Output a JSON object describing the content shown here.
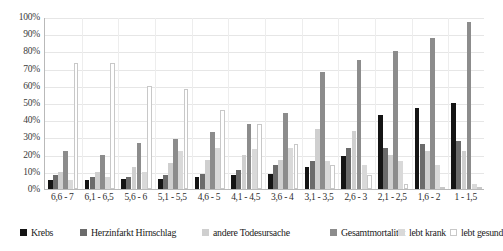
{
  "chart_data": {
    "type": "bar",
    "title": "",
    "subtitle": "",
    "xlabel": "",
    "ylabel": "",
    "ylim": [
      0,
      100
    ],
    "y_unit": "%",
    "grid": true,
    "legend_position": "bottom",
    "categories": [
      "6,6 - 7",
      "6,1 - 6,5",
      "5,6 - 6",
      "5,1 - 5,5",
      "4,6 - 5",
      "4,1 - 4,5",
      "3,6 - 4",
      "3,1 - 3,5",
      "2,6 - 3",
      "2,1 - 2,5",
      "1,6 - 2",
      "1 - 1,5"
    ],
    "ytick_labels": [
      "0%",
      "10%",
      "20%",
      "30%",
      "40%",
      "50%",
      "60%",
      "70%",
      "80%",
      "90%",
      "100%"
    ],
    "ytick_values": [
      0,
      10,
      20,
      30,
      40,
      50,
      60,
      70,
      80,
      90,
      100
    ],
    "series": [
      {
        "name": "Krebs",
        "color": "#141414",
        "border": "#141414",
        "values": [
          5,
          5,
          6,
          6,
          7,
          8,
          9,
          13,
          19,
          43,
          47,
          50
        ]
      },
      {
        "name": "Herzinfarkt Hirnschlag",
        "color": "#6b6b6b",
        "border": "#6b6b6b",
        "values": [
          8,
          7,
          7,
          8,
          9,
          11,
          14,
          16,
          24,
          24,
          26,
          28
        ]
      },
      {
        "name": "andere Todesursache",
        "color": "#cfcfcf",
        "border": "#cfcfcf",
        "values": [
          10,
          10,
          13,
          15,
          17,
          20,
          17,
          35,
          34,
          20,
          22,
          22
        ]
      },
      {
        "name": "Gesamtmortalität",
        "color": "#8c8c8c",
        "border": "#8c8c8c",
        "values": [
          22,
          20,
          27,
          29,
          33,
          38,
          44,
          68,
          75,
          80,
          88,
          97
        ]
      },
      {
        "name": "lebt krank",
        "color": "#d9d9d9",
        "border": "#d9d9d9",
        "values": [
          5,
          7,
          10,
          22,
          24,
          23,
          24,
          16,
          14,
          16,
          14,
          3
        ]
      },
      {
        "name": "lebt gesund",
        "color": "#ffffff",
        "border": "#c8c8c8",
        "values": [
          73,
          73,
          60,
          58,
          46,
          38,
          26,
          14,
          8,
          3,
          1,
          0
        ]
      }
    ]
  },
  "legend": {
    "items": [
      {
        "label": "Krebs"
      },
      {
        "label": "Herzinfarkt Hirnschlag"
      },
      {
        "label": "andere Todesursache"
      },
      {
        "label": "Gesamtmortalität"
      },
      {
        "label": "lebt krank"
      },
      {
        "label": "lebt gesund"
      }
    ]
  }
}
